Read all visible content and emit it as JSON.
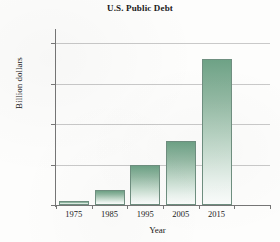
{
  "chart_data": {
    "type": "bar",
    "title": "U.S. Public Debt",
    "xlabel": "Year",
    "ylabel": "Billion dollars",
    "categories": [
      "1975",
      "1985",
      "1995",
      "2005",
      "2015"
    ],
    "values": [
      540,
      1800,
      4900,
      7900,
      18100
    ],
    "ylim": [
      0,
      21500
    ],
    "yticks": [
      0,
      5000,
      10000,
      15000,
      20000
    ],
    "ytick_labels": [
      "0",
      "5,000",
      "10,000",
      "15,000",
      "20,000"
    ],
    "grid": "horizontal",
    "legend": "none",
    "bar_color_top": "#6ea286",
    "bar_color_bottom": "#fbfdfc",
    "bar_border_color": "#6f8f80",
    "gridline_color": "#c9c9c9",
    "axis_color": "#767676",
    "background_color": "#fdfdfc"
  }
}
